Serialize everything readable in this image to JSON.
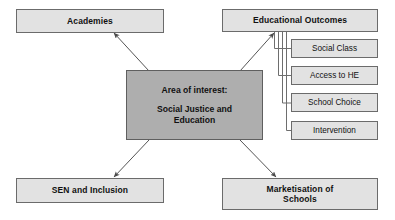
{
  "diagram": {
    "title": "Area of interest: Social Justice and Education",
    "background_color": "#ffffff",
    "node_fill": "#e2e2e2",
    "center_fill": "#aeaeae",
    "border_color": "#6b6b6b",
    "text_color": "#111111",
    "center": {
      "heading": "Area of interest:",
      "subject": "Social Justice and\nEducation"
    },
    "primary_nodes": [
      {
        "id": "academies",
        "label": "Academies"
      },
      {
        "id": "educational-outcomes",
        "label": "Educational Outcomes"
      },
      {
        "id": "sen-and-inclusion",
        "label": "SEN and Inclusion"
      },
      {
        "id": "marketisation-of-schools",
        "label": "Marketisation of\nSchools"
      }
    ],
    "sub_nodes": [
      {
        "id": "social-class",
        "label": "Social Class"
      },
      {
        "id": "access-to-he",
        "label": "Access to HE"
      },
      {
        "id": "school-choice",
        "label": "School Choice"
      },
      {
        "id": "intervention",
        "label": "Intervention"
      }
    ],
    "connections": [
      {
        "from": "center",
        "to": "academies",
        "kind": "arrow"
      },
      {
        "from": "center",
        "to": "educational-outcomes",
        "kind": "arrow"
      },
      {
        "from": "center",
        "to": "sen-and-inclusion",
        "kind": "arrow"
      },
      {
        "from": "center",
        "to": "marketisation-of-schools",
        "kind": "arrow"
      },
      {
        "from": "educational-outcomes",
        "to": "social-class",
        "kind": "bracket"
      },
      {
        "from": "educational-outcomes",
        "to": "access-to-he",
        "kind": "bracket"
      },
      {
        "from": "educational-outcomes",
        "to": "school-choice",
        "kind": "bracket"
      },
      {
        "from": "educational-outcomes",
        "to": "intervention",
        "kind": "bracket"
      }
    ]
  }
}
